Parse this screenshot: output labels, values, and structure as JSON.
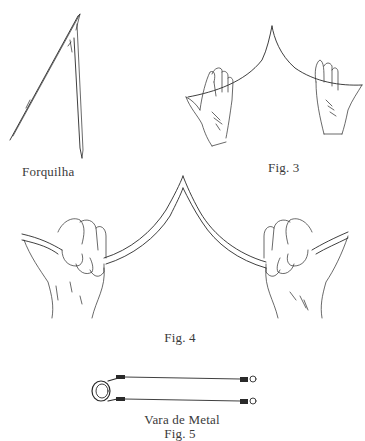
{
  "figures": {
    "forquilha": {
      "label": "Forquilha"
    },
    "fig3": {
      "label": "Fig. 3"
    },
    "fig4": {
      "label": "Fig. 4"
    },
    "fig5": {
      "title": "Vara de Metal",
      "label": "Fig. 5"
    }
  },
  "colors": {
    "ink": "#2a2a2a",
    "text": "#3a3a3a",
    "background": "#ffffff"
  }
}
